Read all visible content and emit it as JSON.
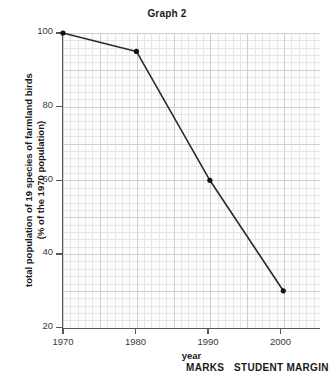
{
  "chart_data": {
    "type": "line",
    "title": "Graph 2",
    "xlabel": "year",
    "ylabel": "total population of 19 species of farmland birds (% of the 1970 population)",
    "ylabel_line1": "total population of 19 species of farmland birds",
    "ylabel_line2": "(% of the 1970 population)",
    "x": [
      1970,
      1980,
      1990,
      2000
    ],
    "values": [
      100,
      95,
      60,
      30
    ],
    "xlim": [
      1970,
      2005
    ],
    "ylim": [
      20,
      100
    ],
    "xticks": [
      "1970",
      "1980",
      "1990",
      "2000"
    ],
    "yticks": [
      "100",
      "80",
      "60",
      "40",
      "20"
    ],
    "grid": true,
    "grid_style": "graph-paper",
    "legend": "none",
    "marker": "filled-circle",
    "line_color": "#2b2b2b",
    "marker_color": "#111111",
    "grid_minor_color": "#e6e6e6",
    "grid_major_color": "#cfcfcf",
    "axis_color": "#55595c",
    "background_color": "#ffffff"
  },
  "footer": {
    "marks_label": "MARKS",
    "student_margin_label": "STUDENT MARGIN"
  }
}
